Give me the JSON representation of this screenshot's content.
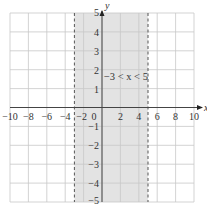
{
  "chart_data": {
    "type": "area",
    "title": "",
    "xlabel": "x",
    "ylabel": "y",
    "xlim": [
      -10,
      10
    ],
    "ylim": [
      -5,
      5
    ],
    "grid": true,
    "grid_step": {
      "x": 2,
      "y": 1
    },
    "x_ticks": [
      -10,
      -8,
      -6,
      -4,
      -2,
      0,
      2,
      4,
      6,
      8,
      10
    ],
    "x_tick_labels": [
      "−10",
      "−8",
      "−6",
      "−4",
      "−2",
      "0",
      "2",
      "4",
      "6",
      "8",
      "10"
    ],
    "y_ticks": [
      -5,
      -4,
      -3,
      -2,
      -1,
      1,
      2,
      3,
      4,
      5
    ],
    "y_tick_labels": [
      "−5",
      "−4",
      "−3",
      "−2",
      "−1",
      "1",
      "2",
      "3",
      "4",
      "5"
    ],
    "shaded_region": {
      "x_min": -3,
      "x_max": 5,
      "boundary_style": "dashed",
      "inclusive": false
    },
    "annotation": "−3 < x < 5",
    "colors": {
      "shade": "#e3e3e3",
      "grid": "#c8c8c8",
      "axis": "#444444",
      "boundary": "#555555"
    }
  }
}
